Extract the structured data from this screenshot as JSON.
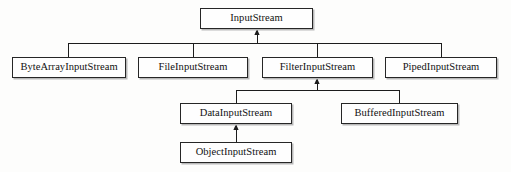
{
  "diagram": {
    "type": "uml-class-hierarchy",
    "background_color": "#fdfdfc",
    "box_fill_color": "#fefefe",
    "box_border_color": "#262626",
    "edge_color": "#1c1c1c",
    "nodes": [
      {
        "id": "InputStream",
        "label": "InputStream",
        "x": 200,
        "y": 8,
        "w": 113,
        "h": 21
      },
      {
        "id": "ByteArrayInputStream",
        "label": "ByteArrayInputStream",
        "x": 12,
        "y": 57,
        "w": 114,
        "h": 21
      },
      {
        "id": "FileInputStream",
        "label": "FileInputStream",
        "x": 138,
        "y": 57,
        "w": 110,
        "h": 21
      },
      {
        "id": "FilterInputStream",
        "label": "FilterInputStream",
        "x": 262,
        "y": 57,
        "w": 111,
        "h": 21
      },
      {
        "id": "PipedInputStream",
        "label": "PipedInputStream",
        "x": 385,
        "y": 57,
        "w": 112,
        "h": 21
      },
      {
        "id": "DataInputStream",
        "label": "DataInputStream",
        "x": 180,
        "y": 103,
        "w": 112,
        "h": 21
      },
      {
        "id": "BufferedInputStream",
        "label": "BufferedInputStream",
        "x": 341,
        "y": 103,
        "w": 117,
        "h": 21
      },
      {
        "id": "ObjectInputStream",
        "label": "ObjectInputStream",
        "x": 180,
        "y": 142,
        "w": 112,
        "h": 21
      }
    ],
    "edges": [
      {
        "from": "ByteArrayInputStream",
        "to": "InputStream",
        "kind": "generalization"
      },
      {
        "from": "FileInputStream",
        "to": "InputStream",
        "kind": "generalization"
      },
      {
        "from": "FilterInputStream",
        "to": "InputStream",
        "kind": "generalization"
      },
      {
        "from": "PipedInputStream",
        "to": "InputStream",
        "kind": "generalization"
      },
      {
        "from": "DataInputStream",
        "to": "FilterInputStream",
        "kind": "generalization"
      },
      {
        "from": "BufferedInputStream",
        "to": "FilterInputStream",
        "kind": "generalization"
      },
      {
        "from": "ObjectInputStream",
        "to": "DataInputStream",
        "kind": "generalization"
      }
    ],
    "routing": {
      "bus_level_1": {
        "y": 43,
        "x_start": 68,
        "x_end": 441,
        "arrow_x": 257,
        "arrow_top": 29
      },
      "bus_level_2": {
        "y": 90,
        "x_start": 236,
        "x_end": 399,
        "arrow_x": 317,
        "arrow_top": 78
      },
      "link_level_3": {
        "x": 236,
        "y_top": 124,
        "y_bottom": 142
      }
    }
  }
}
